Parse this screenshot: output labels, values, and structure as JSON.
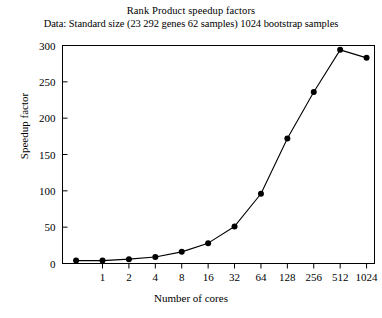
{
  "chart_data": {
    "type": "line",
    "title": "Rank Product speedup factors",
    "subtitle": "Data: Standard size (23 292 genes 62 samples) 1024 bootstrap samples",
    "xlabel": "Number of cores",
    "ylabel": "Speedup factor",
    "x_scale": "log2",
    "x": [
      0.5,
      1,
      2,
      4,
      8,
      16,
      32,
      64,
      128,
      256,
      512,
      1024
    ],
    "xtick_labels": [
      "1",
      "2",
      "4",
      "8",
      "16",
      "32",
      "64",
      "128",
      "256",
      "512",
      "1024"
    ],
    "xtick_values": [
      1,
      2,
      4,
      8,
      16,
      32,
      64,
      128,
      256,
      512,
      1024
    ],
    "values": [
      4,
      4,
      6,
      9,
      16,
      28,
      51,
      96,
      172,
      236,
      294,
      283
    ],
    "ytick_labels": [
      "0",
      "50",
      "100",
      "150",
      "200",
      "250",
      "300"
    ],
    "ytick_values": [
      0,
      50,
      100,
      150,
      200,
      250,
      300
    ],
    "ylim": [
      0,
      300
    ],
    "grid": false,
    "legend": "none",
    "marker": "filled-circle",
    "line_color": "#000000",
    "marker_color": "#000000",
    "axis_color": "#000000",
    "background_color": "#ffffff"
  }
}
